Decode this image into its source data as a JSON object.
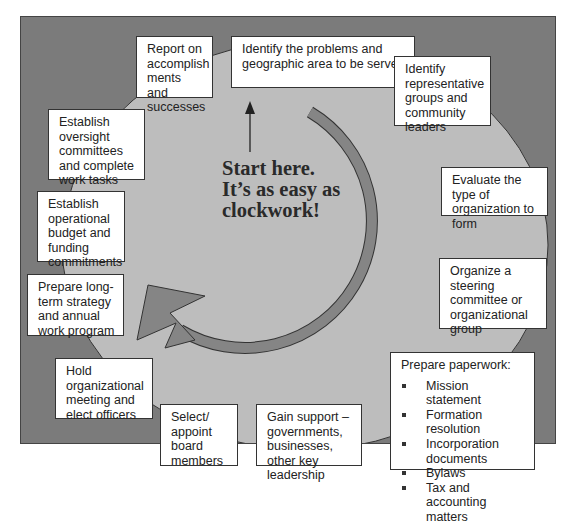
{
  "diagram": {
    "center_text": {
      "line1": "Start here.",
      "line2": "It’s as easy as",
      "line3": "clockwork!"
    },
    "colors": {
      "outer_panel": "#7b7b7b",
      "inner_circle": "#bdbdbd",
      "arrow": "#808080",
      "box_fill": "#ffffff",
      "text": "#222222"
    },
    "steps": [
      {
        "id": 1,
        "text": "Identify the problems and geographic area to be served"
      },
      {
        "id": 2,
        "text": "Identify representative groups and community leaders"
      },
      {
        "id": 3,
        "text": "Evaluate the type of organization to form"
      },
      {
        "id": 4,
        "text": "Organize a steering committee or organizational group"
      },
      {
        "id": 5,
        "text": "Prepare paperwork:",
        "bullets": [
          "Mission statement",
          "Formation resolution",
          "Incorporation documents",
          "Bylaws",
          "Tax and accounting matters"
        ]
      },
      {
        "id": 6,
        "text": "Gain support – governments, businesses, other key leadership"
      },
      {
        "id": 7,
        "text": "Select/ appoint board members"
      },
      {
        "id": 8,
        "text": "Hold organizational meeting and elect officers"
      },
      {
        "id": 9,
        "text": "Prepare long-term strategy and annual work program"
      },
      {
        "id": 10,
        "text": "Establish operational budget and funding commitments"
      },
      {
        "id": 11,
        "text": "Establish oversight committees and complete work tasks"
      },
      {
        "id": 12,
        "text": "Report on accomplish ments and successes"
      }
    ]
  }
}
